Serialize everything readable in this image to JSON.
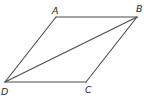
{
  "diagram": {
    "type": "parallelogram",
    "stroke_color": "#4a4a4a",
    "label_color": "#2a2a2a",
    "vertices": [
      {
        "name": "A",
        "x": 56,
        "y": 17,
        "label_x": 52,
        "label_y": 14
      },
      {
        "name": "B",
        "x": 137,
        "y": 17,
        "label_x": 136,
        "label_y": 12
      },
      {
        "name": "C",
        "x": 86,
        "y": 82,
        "label_x": 85,
        "label_y": 93
      },
      {
        "name": "D",
        "x": 5,
        "y": 82,
        "label_x": 1,
        "label_y": 95
      }
    ],
    "edges": [
      {
        "from": "A",
        "to": "B"
      },
      {
        "from": "B",
        "to": "C"
      },
      {
        "from": "C",
        "to": "D"
      },
      {
        "from": "D",
        "to": "A"
      },
      {
        "from": "D",
        "to": "B",
        "kind": "diagonal"
      }
    ]
  }
}
